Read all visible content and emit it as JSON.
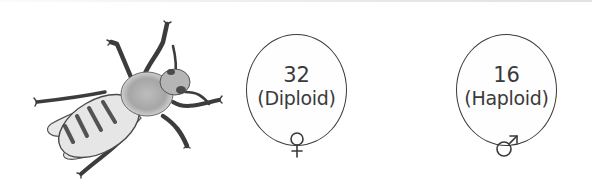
{
  "figure": {
    "illustration_icon": "bee-illustration",
    "colors": {
      "stroke": "#3a3a3a",
      "text": "#3a3a3a",
      "circle_fill": "#fefefe",
      "background": "#ffffff"
    }
  },
  "cells": [
    {
      "sex": "female",
      "chromosome_count": "32",
      "ploidy_label": "(Diploid)",
      "symbol": "♀",
      "symbol_icon": "female-symbol-icon"
    },
    {
      "sex": "male",
      "chromosome_count": "16",
      "ploidy_label": "(Haploid)",
      "symbol": "♂",
      "symbol_icon": "male-symbol-icon"
    }
  ]
}
